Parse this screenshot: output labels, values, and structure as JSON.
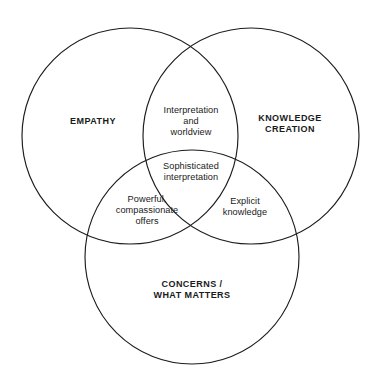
{
  "diagram": {
    "type": "venn-3-circle",
    "background_color": "#ffffff",
    "stroke_color": "#1c1c1c",
    "text_color": "#1a1a1a",
    "sets": [
      {
        "id": "empathy",
        "label": "EMPATHY",
        "position": "left",
        "center_x": 130,
        "center_y": 136,
        "radius": 108
      },
      {
        "id": "knowledge-creation",
        "label": "KNOWLEDGE\nCREATION",
        "position": "right",
        "center_x": 251,
        "center_y": 136,
        "radius": 108
      },
      {
        "id": "concerns-what-matters",
        "label": "CONCERNS /\nWHAT MATTERS",
        "position": "bottom",
        "center_x": 192,
        "center_y": 257,
        "radius": 107
      }
    ],
    "intersections": [
      {
        "id": "empathy-knowledge",
        "label": "Interpretation\nand\nworldview",
        "sets": [
          "empathy",
          "knowledge-creation"
        ]
      },
      {
        "id": "all-three",
        "label": "Sophisticated\ninterpretation",
        "sets": [
          "empathy",
          "knowledge-creation",
          "concerns-what-matters"
        ]
      },
      {
        "id": "empathy-concerns",
        "label": "Powerful,\ncompassionate\noffers",
        "sets": [
          "empathy",
          "concerns-what-matters"
        ]
      },
      {
        "id": "knowledge-concerns",
        "label": "Explicit\nknowledge",
        "sets": [
          "knowledge-creation",
          "concerns-what-matters"
        ]
      }
    ]
  }
}
